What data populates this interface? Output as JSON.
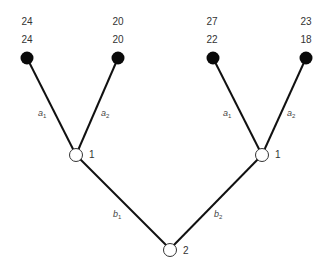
{
  "diagram": {
    "type": "game-tree",
    "root": {
      "label": "2"
    },
    "internal_nodes": [
      {
        "label": "1"
      },
      {
        "label": "1"
      }
    ],
    "edges_level1": {
      "left": {
        "base": "b",
        "sub": "1"
      },
      "right": {
        "base": "b",
        "sub": "2"
      }
    },
    "edges_level2": [
      {
        "left": {
          "base": "a",
          "sub": "1"
        },
        "right": {
          "base": "a",
          "sub": "2"
        }
      },
      {
        "left": {
          "base": "a",
          "sub": "1"
        },
        "right": {
          "base": "a",
          "sub": "2"
        }
      }
    ],
    "leaves": [
      {
        "payoff_top": "24",
        "payoff_bottom": "24"
      },
      {
        "payoff_top": "20",
        "payoff_bottom": "20"
      },
      {
        "payoff_top": "27",
        "payoff_bottom": "22"
      },
      {
        "payoff_top": "23",
        "payoff_bottom": "18"
      }
    ]
  }
}
